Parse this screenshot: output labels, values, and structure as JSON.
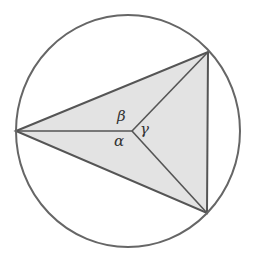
{
  "diagram": {
    "title": "",
    "colors": {
      "background": "#ffffff",
      "stroke": "#555555",
      "fill": "#e3e3e3",
      "label": "#333333"
    },
    "circle": {
      "cx": 128,
      "cy": 131,
      "rx": 112,
      "ry": 116
    },
    "triangle": {
      "vertices": [
        {
          "name": "left",
          "x": 16,
          "y": 131
        },
        {
          "name": "top",
          "x": 208,
          "y": 52
        },
        {
          "name": "bottom",
          "x": 207,
          "y": 213
        }
      ],
      "center": {
        "x": 132,
        "y": 131
      }
    },
    "angles": [
      {
        "symbol": "β",
        "x": 117,
        "y": 109
      },
      {
        "symbol": "α",
        "x": 114,
        "y": 134
      },
      {
        "symbol": "γ",
        "x": 140,
        "y": 122
      }
    ]
  }
}
